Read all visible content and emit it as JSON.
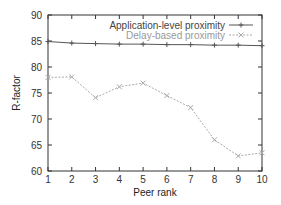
{
  "chart_data": {
    "type": "line",
    "title": "",
    "xlabel": "Peer rank",
    "ylabel": "R-factor",
    "xlim": [
      1,
      10
    ],
    "ylim": [
      60,
      90
    ],
    "x": [
      1,
      2,
      3,
      4,
      5,
      6,
      7,
      8,
      9,
      10
    ],
    "xticks": [
      "1",
      "2",
      "3",
      "4",
      "5",
      "6",
      "7",
      "8",
      "9",
      "10"
    ],
    "yticks": [
      "60",
      "65",
      "70",
      "75",
      "80",
      "85",
      "90"
    ],
    "grid": false,
    "legend_position": "top-right",
    "series": [
      {
        "name": "Application-level proximity",
        "marker": "+",
        "color": "#555555",
        "values": [
          84.9,
          84.6,
          84.5,
          84.4,
          84.4,
          84.3,
          84.3,
          84.2,
          84.2,
          84.1
        ]
      },
      {
        "name": "Delay-based proximity",
        "marker": "x",
        "color": "#aaaaaa",
        "dashed": true,
        "values": [
          78.0,
          78.1,
          74.1,
          76.2,
          76.9,
          74.5,
          72.2,
          66.0,
          62.9,
          63.5
        ]
      }
    ]
  }
}
